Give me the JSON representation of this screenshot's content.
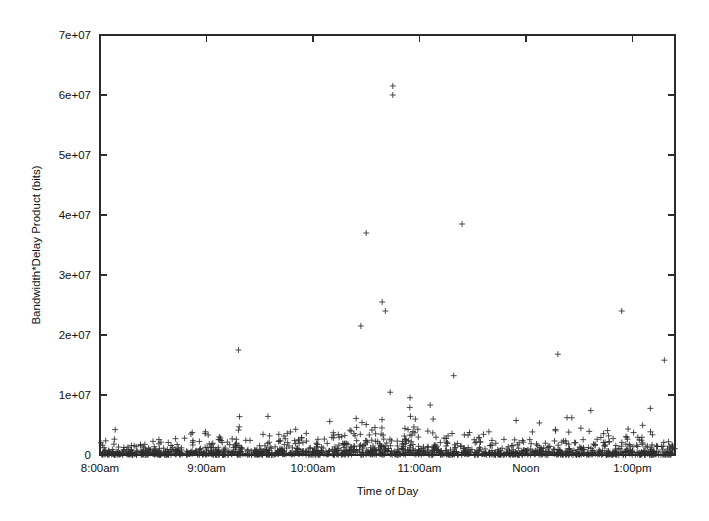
{
  "figure": {
    "width": 709,
    "height": 521,
    "background_color": "#ffffff",
    "ink_color": "#2b2b2b"
  },
  "chart_data": {
    "type": "scatter",
    "title": "",
    "subtitle": "",
    "xlabel": "Time of Day",
    "ylabel": "Bandwidth*Delay Product (bits)",
    "marker": "plus",
    "marker_color": "#2e2e2e",
    "marker_size_px": 6,
    "grid": false,
    "legend": null,
    "legend_position": "none",
    "frame": {
      "left_px": 100,
      "right_px": 675,
      "top_px": 35,
      "bottom_px": 455
    },
    "x_axis": {
      "label": "Time of Day",
      "tick_labels": [
        "8:00am",
        "9:00am",
        "10:00am",
        "11:00am",
        "Noon",
        "1:00pm"
      ],
      "tick_values_hours": [
        8,
        9,
        10,
        11,
        12,
        13
      ],
      "xlim_hours": [
        8,
        13.4
      ],
      "minor_ticks": false
    },
    "y_axis": {
      "label": "Bandwidth*Delay Product (bits)",
      "tick_labels": [
        "0",
        "1e+07",
        "2e+07",
        "3e+07",
        "4e+07",
        "5e+07",
        "6e+07",
        "7e+07"
      ],
      "tick_values": [
        0,
        10000000,
        20000000,
        30000000,
        40000000,
        50000000,
        60000000,
        70000000
      ],
      "ylim": [
        0,
        70000000
      ],
      "minor_ticks": false
    },
    "notable_outliers": [
      {
        "x_hours": 10.75,
        "y": 61500000,
        "note": "highest point, just before 11:00am"
      },
      {
        "x_hours": 10.75,
        "y": 60000000,
        "note": "second highest point"
      },
      {
        "x_hours": 10.5,
        "y": 37000000
      },
      {
        "x_hours": 11.4,
        "y": 38500000
      },
      {
        "x_hours": 10.65,
        "y": 25500000
      },
      {
        "x_hours": 10.68,
        "y": 24000000
      },
      {
        "x_hours": 12.9,
        "y": 24000000
      },
      {
        "x_hours": 10.45,
        "y": 21500000
      },
      {
        "x_hours": 9.3,
        "y": 17500000
      },
      {
        "x_hours": 12.3,
        "y": 16800000
      },
      {
        "x_hours": 13.3,
        "y": 15800000
      }
    ],
    "density_description": "Dense band of points hugging y=0 across the whole window, with exponentially thinning density upward; most mass below 5e+06.",
    "approx_point_count": 1400,
    "series": [
      {
        "name": "bandwidth-delay samples",
        "points_hint": "generated deterministically from seed to match observed density envelope"
      }
    ]
  }
}
